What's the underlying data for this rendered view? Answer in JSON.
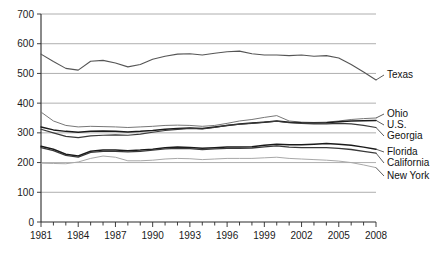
{
  "chart_data": {
    "type": "line",
    "title": "",
    "subtitle": "",
    "xlabel": "",
    "ylabel": "",
    "ylim": [
      0,
      700
    ],
    "ytick_step": 100,
    "yticks": [
      0,
      100,
      200,
      300,
      400,
      500,
      600,
      700
    ],
    "xlim": [
      1981,
      2008
    ],
    "xticks": [
      1981,
      1984,
      1987,
      1990,
      1993,
      1996,
      1999,
      2002,
      2005,
      2008
    ],
    "xtick_labels": [
      "1981",
      "1984",
      "1987",
      "1990",
      "1993",
      "1996",
      "1999",
      "2002",
      "2005",
      "2008"
    ],
    "minor_xticks_every_year": true,
    "grid": "horizontal",
    "legend_position": "right-inline-labels",
    "x": [
      1981,
      1982,
      1983,
      1984,
      1985,
      1986,
      1987,
      1988,
      1989,
      1990,
      1991,
      1992,
      1993,
      1994,
      1995,
      1996,
      1997,
      1998,
      1999,
      2000,
      2001,
      2002,
      2003,
      2004,
      2005,
      2006,
      2007,
      2008
    ],
    "series": [
      {
        "name": "Texas",
        "label": "Texas",
        "color": "#555555",
        "width": 1.1,
        "values": [
          565,
          540,
          517,
          511,
          541,
          544,
          535,
          522,
          530,
          548,
          558,
          565,
          566,
          562,
          568,
          573,
          575,
          566,
          562,
          562,
          560,
          562,
          558,
          560,
          552,
          530,
          505,
          478
        ]
      },
      {
        "name": "Ohio",
        "label": "Ohio",
        "color": "#777777",
        "width": 1.0,
        "values": [
          370,
          340,
          325,
          320,
          322,
          321,
          320,
          318,
          320,
          322,
          325,
          326,
          325,
          322,
          325,
          332,
          340,
          345,
          352,
          358,
          340,
          336,
          335,
          336,
          340,
          345,
          348,
          350
        ]
      },
      {
        "name": "U.S.",
        "label": "U.S.",
        "color": "#1a1a1a",
        "width": 1.5,
        "values": [
          320,
          310,
          305,
          302,
          305,
          306,
          305,
          303,
          305,
          308,
          312,
          315,
          316,
          315,
          320,
          325,
          330,
          333,
          336,
          340,
          336,
          334,
          333,
          334,
          337,
          340,
          341,
          342
        ]
      },
      {
        "name": "Georgia",
        "label": "Georgia",
        "color": "#3a3a3a",
        "width": 1.2,
        "values": [
          312,
          300,
          288,
          284,
          290,
          292,
          293,
          292,
          296,
          302,
          308,
          312,
          315,
          313,
          318,
          325,
          329,
          332,
          336,
          339,
          334,
          332,
          330,
          330,
          332,
          330,
          325,
          318
        ]
      },
      {
        "name": "Florida",
        "label": "Florida",
        "color": "#1a1a1a",
        "width": 1.5,
        "values": [
          255,
          245,
          228,
          222,
          238,
          242,
          242,
          240,
          242,
          245,
          250,
          252,
          251,
          248,
          250,
          252,
          252,
          253,
          258,
          262,
          260,
          260,
          262,
          264,
          262,
          258,
          252,
          245
        ]
      },
      {
        "name": "California",
        "label": "California",
        "color": "#3a3a3a",
        "width": 1.3,
        "values": [
          250,
          240,
          224,
          218,
          234,
          238,
          238,
          236,
          238,
          242,
          246,
          248,
          247,
          244,
          246,
          248,
          248,
          249,
          253,
          256,
          252,
          250,
          250,
          250,
          248,
          244,
          238,
          232
        ]
      },
      {
        "name": "New York",
        "label": "New York",
        "color": "#a8a8a8",
        "width": 1.0,
        "values": [
          198,
          197,
          196,
          202,
          214,
          222,
          218,
          206,
          206,
          208,
          212,
          214,
          213,
          210,
          212,
          214,
          214,
          214,
          216,
          218,
          214,
          212,
          210,
          208,
          205,
          200,
          192,
          183
        ]
      }
    ]
  }
}
